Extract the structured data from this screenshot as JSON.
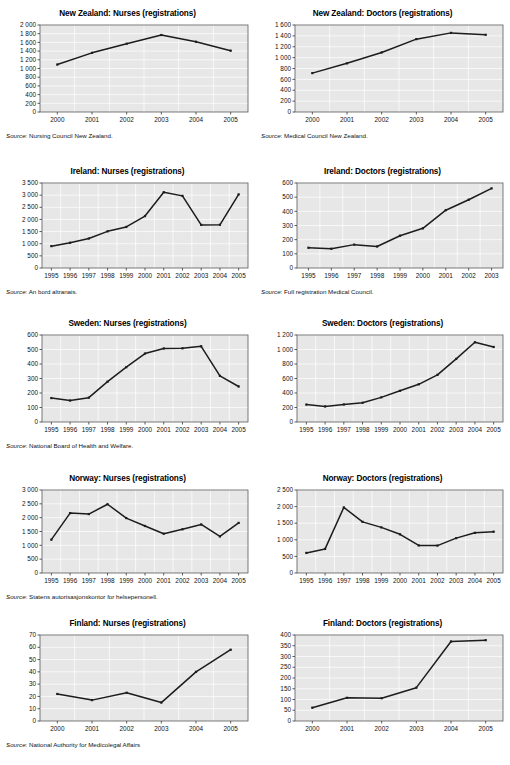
{
  "page": {
    "cut_off_header": "",
    "source_label": "Source",
    "axis_thousand_separator": " "
  },
  "charts": [
    {
      "id": "new-zealand-nurses",
      "source": "Nursing Council New Zealand.",
      "chart_data": {
        "type": "line",
        "title": "New Zealand: Nurses (registrations)",
        "xlabel": "",
        "ylabel": "",
        "categories": [
          "2000",
          "2001",
          "2002",
          "2003",
          "2004",
          "2005"
        ],
        "values": [
          1090,
          1360,
          1570,
          1770,
          1615,
          1410
        ],
        "yticks": [
          0,
          200,
          400,
          600,
          800,
          1000,
          1200,
          1400,
          1600,
          1800,
          2000
        ],
        "yticklabels": [
          "0",
          "200",
          "400",
          "600",
          "800",
          "1 000",
          "1 200",
          "1 400",
          "1 600",
          "1 800",
          "2 000"
        ],
        "ylim": [
          0,
          2000
        ],
        "grid": true,
        "legend": "none"
      }
    },
    {
      "id": "new-zealand-doctors",
      "source": "Medical Council New Zealand.",
      "chart_data": {
        "type": "line",
        "title": "New Zealand: Doctors (registrations)",
        "xlabel": "",
        "ylabel": "",
        "categories": [
          "2000",
          "2001",
          "2002",
          "2003",
          "2004",
          "2005"
        ],
        "values": [
          715,
          895,
          1095,
          1340,
          1455,
          1420
        ],
        "yticks": [
          0,
          200,
          400,
          600,
          800,
          1000,
          1200,
          1400,
          1600
        ],
        "yticklabels": [
          "0",
          "200",
          "400",
          "600",
          "800",
          "1 000",
          "1 200",
          "1 400",
          "1 600"
        ],
        "ylim": [
          0,
          1600
        ],
        "grid": true,
        "legend": "none"
      }
    },
    {
      "id": "ireland-nurses",
      "source": "An bord altranais.",
      "chart_data": {
        "type": "line",
        "title": "Ireland:  Nurses (registrations)",
        "xlabel": "",
        "ylabel": "",
        "categories": [
          "1995",
          "1996",
          "1997",
          "1998",
          "1999",
          "2000",
          "2001",
          "2002",
          "2003",
          "2004",
          "2005"
        ],
        "values": [
          900,
          1040,
          1215,
          1510,
          1690,
          2140,
          3120,
          2970,
          1775,
          1780,
          3030
        ],
        "yticks": [
          0,
          500,
          1000,
          1500,
          2000,
          2500,
          3000,
          3500
        ],
        "yticklabels": [
          "0",
          "500",
          "1 000",
          "1 500",
          "2 000",
          "2 500",
          "3 000",
          "3 500"
        ],
        "ylim": [
          0,
          3500
        ],
        "grid": true,
        "legend": "none"
      }
    },
    {
      "id": "ireland-doctors",
      "source": "Full registration Medical Council.",
      "chart_data": {
        "type": "line",
        "title": "Ireland: Doctors (registrations)",
        "xlabel": "",
        "ylabel": "",
        "categories": [
          "1995",
          "1996",
          "1997",
          "1998",
          "1999",
          "2000",
          "2001",
          "2002",
          "2003"
        ],
        "values": [
          143,
          136,
          165,
          152,
          228,
          280,
          408,
          482,
          562
        ],
        "yticks": [
          0,
          100,
          200,
          300,
          400,
          500,
          600
        ],
        "yticklabels": [
          "0",
          "100",
          "200",
          "300",
          "400",
          "500",
          "600"
        ],
        "ylim": [
          0,
          600
        ],
        "grid": true,
        "legend": "none"
      }
    },
    {
      "id": "sweden-nurses",
      "source": "National Board of Health and Welfare.",
      "chart_data": {
        "type": "line",
        "title": "Sweden:  Nurses (registrations)",
        "xlabel": "",
        "ylabel": "",
        "categories": [
          "1995",
          "1996",
          "1997",
          "1998",
          "1999",
          "2000",
          "2001",
          "2002",
          "2003",
          "2004",
          "2005"
        ],
        "values": [
          165,
          148,
          168,
          278,
          378,
          472,
          507,
          508,
          522,
          318,
          245
        ],
        "yticks": [
          0,
          100,
          200,
          300,
          400,
          500,
          600
        ],
        "yticklabels": [
          "0",
          "100",
          "200",
          "300",
          "400",
          "500",
          "600"
        ],
        "ylim": [
          0,
          600
        ],
        "grid": true,
        "legend": "none"
      }
    },
    {
      "id": "sweden-doctors",
      "source": "",
      "chart_data": {
        "type": "line",
        "title": "Sweden: Doctors (registrations)",
        "xlabel": "",
        "ylabel": "",
        "categories": [
          "1995",
          "1996",
          "1997",
          "1998",
          "1999",
          "2000",
          "2001",
          "2002",
          "2003",
          "2004",
          "2005"
        ],
        "values": [
          240,
          215,
          242,
          265,
          340,
          430,
          520,
          650,
          870,
          1100,
          1035
        ],
        "yticks": [
          0,
          200,
          400,
          600,
          800,
          1000,
          1200
        ],
        "yticklabels": [
          "0",
          "200",
          "400",
          "600",
          "800",
          "1 000",
          "1 200"
        ],
        "ylim": [
          0,
          1200
        ],
        "grid": true,
        "legend": "none"
      }
    },
    {
      "id": "norway-nurses",
      "source": "Statens autorisasjonskontor for helsepersonell.",
      "chart_data": {
        "type": "line",
        "title": "Norway:  Nurses (registrations)",
        "xlabel": "",
        "ylabel": "",
        "categories": [
          "1995",
          "1996",
          "1997",
          "1998",
          "1999",
          "2000",
          "2001",
          "2002",
          "2003",
          "2004",
          "2005"
        ],
        "values": [
          1205,
          2165,
          2130,
          2485,
          1985,
          1700,
          1420,
          1580,
          1755,
          1320,
          1810
        ],
        "yticks": [
          0,
          500,
          1000,
          1500,
          2000,
          2500,
          3000
        ],
        "yticklabels": [
          "0",
          "500",
          "1 000",
          "1 500",
          "2 000",
          "2 500",
          "3 000"
        ],
        "ylim": [
          0,
          3000
        ],
        "grid": true,
        "legend": "none"
      }
    },
    {
      "id": "norway-doctors",
      "source": "",
      "chart_data": {
        "type": "line",
        "title": "Norway: Doctors (registrations)",
        "xlabel": "",
        "ylabel": "",
        "categories": [
          "1995",
          "1996",
          "1997",
          "1998",
          "1999",
          "2000",
          "2001",
          "2002",
          "2003",
          "2004",
          "2005"
        ],
        "values": [
          605,
          725,
          1975,
          1540,
          1375,
          1165,
          830,
          825,
          1050,
          1210,
          1245
        ],
        "yticks": [
          0,
          500,
          1000,
          1500,
          2000,
          2500
        ],
        "yticklabels": [
          "0",
          "500",
          "1 000",
          "1 500",
          "2 000",
          "2 500"
        ],
        "ylim": [
          0,
          2500
        ],
        "grid": true,
        "legend": "none"
      }
    },
    {
      "id": "finland-nurses",
      "source": "National Authority for Medicolegal Affairs",
      "chart_data": {
        "type": "line",
        "title": "Finland:  Nurses (registrations)",
        "xlabel": "",
        "ylabel": "",
        "categories": [
          "2000",
          "2001",
          "2002",
          "2003",
          "2004",
          "2005"
        ],
        "values": [
          22,
          17,
          23,
          15,
          40,
          58
        ],
        "yticks": [
          0,
          10,
          20,
          30,
          40,
          50,
          60,
          70
        ],
        "yticklabels": [
          "0",
          "10",
          "20",
          "30",
          "40",
          "50",
          "60",
          "70"
        ],
        "ylim": [
          0,
          70
        ],
        "grid": true,
        "legend": "none"
      }
    },
    {
      "id": "finland-doctors",
      "source": "",
      "chart_data": {
        "type": "line",
        "title": "Finland: Doctors (registrations)",
        "xlabel": "",
        "ylabel": "",
        "categories": [
          "2000",
          "2001",
          "2002",
          "2003",
          "2004",
          "2005"
        ],
        "values": [
          62,
          108,
          106,
          155,
          370,
          376
        ],
        "yticks": [
          0,
          50,
          100,
          150,
          200,
          250,
          300,
          350,
          400
        ],
        "yticklabels": [
          "0",
          "50",
          "100",
          "150",
          "200",
          "250",
          "300",
          "350",
          "400"
        ],
        "ylim": [
          0,
          400
        ],
        "grid": true,
        "legend": "none"
      }
    }
  ]
}
